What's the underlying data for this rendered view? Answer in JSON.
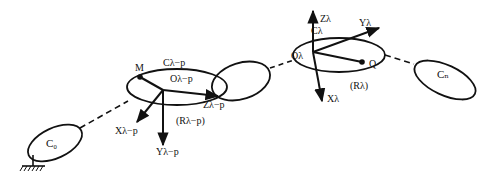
{
  "diagram": {
    "type": "kinematic-chain",
    "colors": {
      "stroke": "#111111",
      "background": "#ffffff"
    },
    "bodies": [
      {
        "id": "C0",
        "label": "C₀",
        "role": "base body (grounded)"
      },
      {
        "id": "C_lambda_minus_p",
        "label": "Cλ−p",
        "origin_label": "Oλ−p",
        "frame_label": "(Rλ−p)",
        "point_label": "M"
      },
      {
        "id": "C_intermediate",
        "label": ""
      },
      {
        "id": "C_lambda",
        "label": "Cλ",
        "origin_label": "Oλ",
        "frame_label": "(Rλ)",
        "point_label": "Q"
      },
      {
        "id": "Cn",
        "label": "Cₙ",
        "role": "end body"
      }
    ],
    "axes": {
      "lambda_minus_p": {
        "x": "Xλ−p",
        "y": "Yλ−p",
        "z": "Zλ−p"
      },
      "lambda": {
        "x": "Xλ",
        "y": "Yλ",
        "z": "Zλ"
      }
    },
    "labels": {
      "c0": "C₀",
      "cn": "Cₙ",
      "c_lp": "Cλ−p",
      "o_lp": "Oλ−p",
      "r_lp": "(Rλ−p)",
      "m": "M",
      "x_lp": "Xλ−p",
      "y_lp": "Yλ−p",
      "z_lp": "Zλ−p",
      "c_l": "Cλ",
      "o_l": "Oλ",
      "r_l": "(Rλ)",
      "q": "Q",
      "x_l": "Xλ",
      "y_l": "Yλ",
      "z_l": "Zλ"
    }
  }
}
